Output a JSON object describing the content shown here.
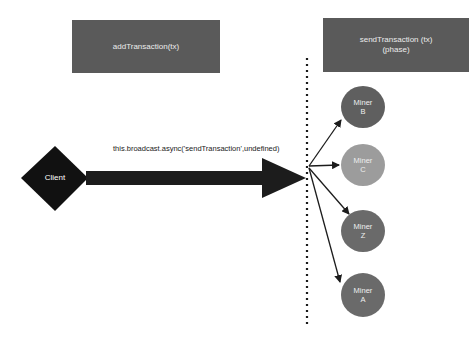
{
  "boxes": {
    "add_transaction": {
      "line1": "addTransaction(tx)"
    },
    "send_transaction": {
      "line1": "sendTransaction (tx)",
      "line2": "(phase)"
    }
  },
  "client": {
    "label": "Client"
  },
  "message": {
    "label": "this.broadcast.async('sendTransaction',undefined)"
  },
  "miners": [
    {
      "line1": "Miner",
      "line2": "B",
      "color": "#5f5f5f"
    },
    {
      "line1": "Miner",
      "line2": "C",
      "color": "#9c9c9c"
    },
    {
      "line1": "Miner",
      "line2": "Z",
      "color": "#6a6a6a"
    },
    {
      "line1": "Miner",
      "line2": "A",
      "color": "#6a6a6a"
    }
  ],
  "colors": {
    "box_fill": "#5a5a5a",
    "client_fill": "#111111",
    "arrow": "#1c1c1c",
    "background": "#ffffff"
  }
}
